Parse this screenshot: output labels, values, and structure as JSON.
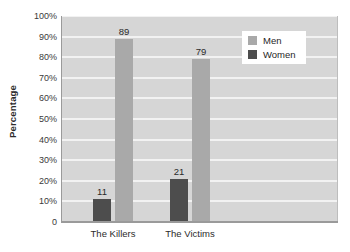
{
  "chart_data": {
    "type": "bar",
    "title": "",
    "xlabel": "",
    "ylabel": "Percentage",
    "categories": [
      "The Killers",
      "The Victims"
    ],
    "series": [
      {
        "name": "Women",
        "values": [
          11,
          21
        ],
        "color": "#4d4d4d"
      },
      {
        "name": "Men",
        "values": [
          89,
          79
        ],
        "color": "#a9a9a9"
      }
    ],
    "series_draw_order": [
      "Women",
      "Men"
    ],
    "ylim": [
      0,
      100
    ],
    "yticks": [
      0,
      10,
      20,
      30,
      40,
      50,
      60,
      70,
      80,
      90,
      100
    ],
    "ytick_labels": [
      "0",
      "10%",
      "20%",
      "30%",
      "40%",
      "50%",
      "60%",
      "70%",
      "80%",
      "90%",
      "100%"
    ],
    "data_labels": [
      "11",
      "89",
      "21",
      "79"
    ],
    "grid": true,
    "grid_color": "#f2f2f2",
    "plot_background": "#d6d6d6",
    "legend_position": "top-right",
    "legend_entries": [
      "Men",
      "Women"
    ]
  },
  "axes": {
    "y_title": "Percentage"
  },
  "legend": {
    "items": [
      {
        "label": "Men",
        "color": "#a9a9a9"
      },
      {
        "label": "Women",
        "color": "#4d4d4d"
      }
    ]
  }
}
